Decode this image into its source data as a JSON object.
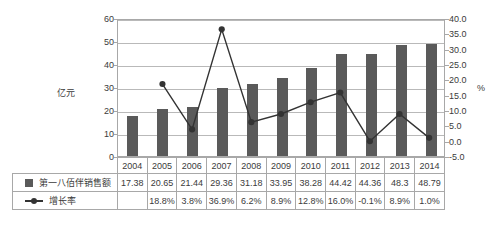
{
  "chart_data": {
    "type": "bar",
    "title": "",
    "categories": [
      "2004",
      "2005",
      "2006",
      "2007",
      "2008",
      "2009",
      "2010",
      "2011",
      "2012",
      "2013",
      "2014"
    ],
    "series": [
      {
        "name": "第一八佰伴销售额",
        "type": "bar",
        "axis": "left",
        "values": [
          17.38,
          20.65,
          21.44,
          29.36,
          31.18,
          33.95,
          38.28,
          44.42,
          44.36,
          48.3,
          48.79
        ],
        "labels": [
          "17.38",
          "20.65",
          "21.44",
          "29.36",
          "31.18",
          "33.95",
          "38.28",
          "44.42",
          "44.36",
          "48.3",
          "48.79"
        ],
        "color": "#5a5a5a"
      },
      {
        "name": "增长率",
        "type": "line",
        "axis": "right",
        "values": [
          null,
          18.8,
          3.8,
          36.9,
          6.2,
          8.9,
          12.8,
          16.0,
          -0.1,
          8.9,
          1.0
        ],
        "labels": [
          "",
          "18.8%",
          "3.8%",
          "36.9%",
          "6.2%",
          "8.9%",
          "12.8%",
          "16.0%",
          "-0.1%",
          "8.9%",
          "1.0%"
        ],
        "color": "#333333"
      }
    ],
    "xlabel": "",
    "ylabel": "亿元",
    "y2label": "%",
    "ylim": [
      0,
      60
    ],
    "y2lim": [
      -5.0,
      40.0
    ],
    "yticks": [
      "0",
      "10",
      "20",
      "30",
      "40",
      "50",
      "60"
    ],
    "ytick_values": [
      0,
      10,
      20,
      30,
      40,
      50,
      60
    ],
    "y2ticks": [
      "-5.0",
      "0.0",
      "5.0",
      "10.0",
      "15.0",
      "20.0",
      "25.0",
      "30.0",
      "35.0",
      "40.0"
    ],
    "y2tick_values": [
      -5.0,
      0.0,
      5.0,
      10.0,
      15.0,
      20.0,
      25.0,
      30.0,
      35.0,
      40.0
    ],
    "grid": true,
    "legend_position": "data-table"
  },
  "axis": {
    "left_unit": "亿元",
    "right_unit": "%"
  },
  "table": {
    "years": [
      "2004",
      "2005",
      "2006",
      "2007",
      "2008",
      "2009",
      "2010",
      "2011",
      "2012",
      "2013",
      "2014"
    ],
    "rows": [
      {
        "label": "第一八佰伴销售额",
        "marker": "square-marker",
        "cells": [
          "17.38",
          "20.65",
          "21.44",
          "29.36",
          "31.18",
          "33.95",
          "38.28",
          "44.42",
          "44.36",
          "48.3",
          "48.79"
        ]
      },
      {
        "label": "增长率",
        "marker": "line-marker",
        "cells": [
          "",
          "18.8%",
          "3.8%",
          "36.9%",
          "6.2%",
          "8.9%",
          "12.8%",
          "16.0%",
          "-0.1%",
          "8.9%",
          "1.0%"
        ]
      }
    ]
  },
  "colors": {
    "bar": "#5a5a5a",
    "line": "#333333",
    "grid": "#b9b9b9",
    "border": "#a8a8a8",
    "text": "#3b3b3b",
    "background": "#ffffff"
  }
}
